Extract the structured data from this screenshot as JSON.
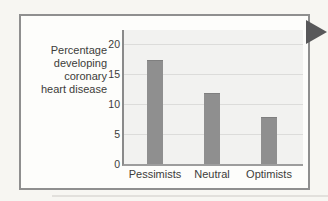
{
  "figure": {
    "axis_text": "Percentage\ndeveloping\ncoronary\nheart disease"
  },
  "chart_data": {
    "type": "bar",
    "title": "",
    "categories": [
      "Pessimists",
      "Neutral",
      "Optimists"
    ],
    "values": [
      17.3,
      11.8,
      7.8
    ],
    "xlabel": "",
    "ylabel": "Percentage developing coronary heart disease",
    "ylim": [
      0,
      22.3
    ],
    "yticks": [
      0,
      5,
      10,
      15,
      20
    ],
    "grid": true,
    "legend_position": "none",
    "bar_color": "#8f8f8f",
    "plot_background": "#f2f2f0",
    "gridline_color": "#dcdcda"
  },
  "colors": {
    "page_background": "#f7f6f2",
    "frame_background": "#fdfdfb",
    "frame_border": "#8f8f8f",
    "axis_line": "#8a8a8a",
    "text": "#3c3c3a",
    "arrow_marker": "#58585a"
  }
}
